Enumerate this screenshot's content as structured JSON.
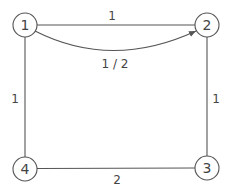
{
  "diagram": {
    "type": "graph",
    "nodes": [
      {
        "id": "1",
        "label": "1",
        "x": 25,
        "y": 25
      },
      {
        "id": "2",
        "label": "2",
        "x": 207,
        "y": 25
      },
      {
        "id": "3",
        "label": "3",
        "x": 207,
        "y": 168
      },
      {
        "id": "4",
        "label": "4",
        "x": 25,
        "y": 169
      }
    ],
    "edges": [
      {
        "from": "1",
        "to": "2",
        "label": "1",
        "directed": false
      },
      {
        "from": "1",
        "to": "2",
        "label": "1 / 2",
        "directed": true,
        "curved": true
      },
      {
        "from": "2",
        "to": "3",
        "label": "1",
        "directed": false
      },
      {
        "from": "1",
        "to": "4",
        "label": "1",
        "directed": false
      },
      {
        "from": "4",
        "to": "3",
        "label": "2",
        "directed": false
      }
    ]
  },
  "labels": {
    "node1": "1",
    "node2": "2",
    "node3": "3",
    "node4": "4",
    "edge_1_2": "1",
    "edge_1_2_curved": "1 / 2",
    "edge_2_3": "1",
    "edge_1_4": "1",
    "edge_4_3": "2"
  },
  "colors": {
    "stroke": "#555555",
    "text": "#444444",
    "background": "#ffffff"
  }
}
